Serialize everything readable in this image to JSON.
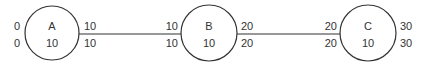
{
  "diagram": {
    "stroke_color": "#333333",
    "background": "#ffffff",
    "nodes": [
      {
        "id": "A",
        "label": "A",
        "value": "10",
        "left_top": "0",
        "left_bottom": "0",
        "right_top": "10",
        "right_bottom": "10",
        "cx": 52,
        "cy": 33,
        "r": 27
      },
      {
        "id": "B",
        "label": "B",
        "value": "10",
        "left_top": "10",
        "left_bottom": "10",
        "right_top": "20",
        "right_bottom": "20",
        "cx": 209,
        "cy": 33,
        "r": 28
      },
      {
        "id": "C",
        "label": "C",
        "value": "10",
        "left_top": "20",
        "left_bottom": "20",
        "right_top": "30",
        "right_bottom": "30",
        "cx": 368,
        "cy": 33,
        "r": 28
      }
    ],
    "edges": [
      {
        "from": "A",
        "to": "B"
      },
      {
        "from": "B",
        "to": "C"
      }
    ]
  }
}
